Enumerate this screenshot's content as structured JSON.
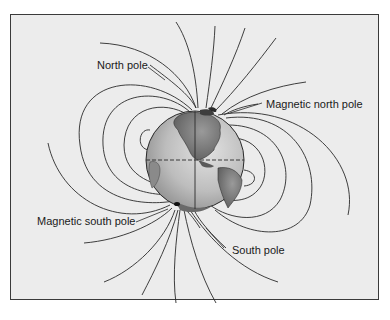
{
  "diagram": {
    "labels": {
      "north_pole": "North pole",
      "magnetic_north_pole": "Magnetic north pole",
      "magnetic_south_pole": "Magnetic south pole",
      "south_pole": "South pole"
    },
    "colors": {
      "background": "#ececec",
      "frame": "#3a3a3a",
      "field_lines": "#2a2a2a",
      "ocean": "#c8c8c8",
      "land": "#6e6e6e"
    }
  }
}
